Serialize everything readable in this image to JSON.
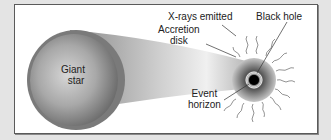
{
  "diagram": {
    "labels": {
      "giant_star_line1": "Giant",
      "giant_star_line2": "star",
      "xrays": "X-rays emitted",
      "black_hole": "Black hole",
      "accretion_line1": "Accretion",
      "accretion_line2": "disk",
      "event_line1": "Event",
      "event_line2": "horizon"
    },
    "colors": {
      "background": "#e4e4e4",
      "panel": "#ffffff",
      "border": "#5a5a5a",
      "star_dark": "#6e6e6e",
      "star_light": "#cfcfcf",
      "black_hole": "#000000"
    }
  }
}
